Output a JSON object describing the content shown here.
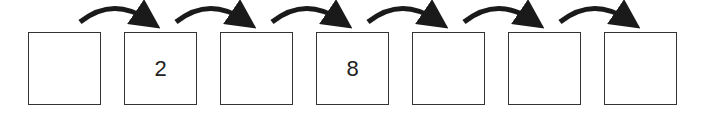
{
  "diagram": {
    "type": "number-sequence",
    "boxes": [
      {
        "value": ""
      },
      {
        "value": "2"
      },
      {
        "value": ""
      },
      {
        "value": "8"
      },
      {
        "value": ""
      },
      {
        "value": ""
      },
      {
        "value": ""
      }
    ],
    "arrows": 6,
    "colors": {
      "stroke": "#333333",
      "arrow": "#1a1a1a"
    }
  }
}
